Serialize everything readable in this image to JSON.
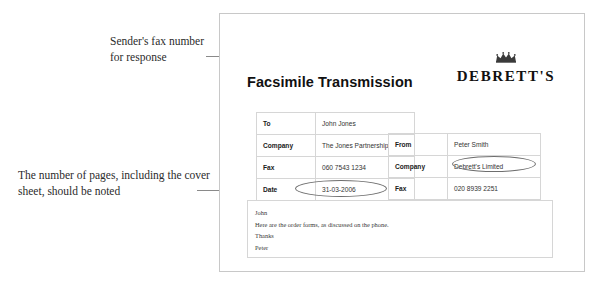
{
  "annotations": [
    {
      "id": "sender-fax",
      "text": "Sender's fax number for response"
    },
    {
      "id": "pages",
      "text": "The number of pages, including the cover sheet, should be noted"
    }
  ],
  "document": {
    "title": "Facsimile Transmission",
    "brand": {
      "wordmark": "DEBRETT'S",
      "crown_icon": "crown-icon"
    },
    "recipient": {
      "rows": [
        {
          "label": "To",
          "value": "John Jones"
        },
        {
          "label": "Company",
          "value": "The Jones Partnership"
        },
        {
          "label": "Fax",
          "value": "060 7543 1234"
        },
        {
          "label": "Date",
          "value": "31-03-2006"
        },
        {
          "label": "Pages",
          "value": "3 (including cover sheet)"
        }
      ]
    },
    "sender": {
      "rows": [
        {
          "label": "From",
          "value": "Peter Smith"
        },
        {
          "label": "Company",
          "value": "Debrett's Limited"
        },
        {
          "label": "Fax",
          "value": "020 8939 2251"
        },
        {
          "label": "Tel",
          "value": "020 8939 2256"
        }
      ]
    },
    "message": {
      "lines": [
        "John",
        "Here are the order forms, as discussed on the phone.",
        "Thanks",
        "Peter"
      ]
    }
  },
  "colors": {
    "page_border": "#c8c8c8",
    "table_border": "#d6d6d6",
    "leader_line": "#8a8a8a",
    "highlight_ring": "#6e6e6e",
    "text": "#333333"
  }
}
